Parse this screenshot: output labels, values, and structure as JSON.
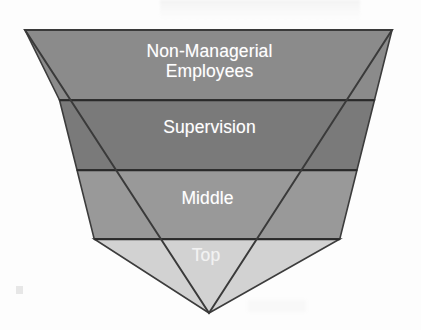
{
  "diagram": {
    "type": "inverted-pyramid",
    "background_color": "#fdfdfd",
    "outline_color": "#3c3c3c",
    "divider_color": "#2e2e2e",
    "label_color": "#ffffff",
    "geometry": {
      "top_left_x": 25,
      "top_right_x": 392,
      "top_y": 30,
      "apex_x": 209,
      "apex_y": 313
    },
    "levels": [
      {
        "label": "Non-Managerial Employees",
        "label_lines": [
          "Non-Managerial",
          "Employees"
        ],
        "fill_color": "#8b8b8b",
        "order": 1,
        "top_y": 30,
        "bottom_y": 100
      },
      {
        "label": "Supervision",
        "label_lines": [
          "Supervision"
        ],
        "fill_color": "#7a7a7a",
        "order": 2,
        "top_y": 100,
        "bottom_y": 170
      },
      {
        "label": "Middle",
        "label_lines": [
          "Middle"
        ],
        "fill_color": "#999999",
        "order": 3,
        "top_y": 170,
        "bottom_y": 239
      },
      {
        "label": "Top",
        "label_lines": [
          "Top"
        ],
        "fill_color": "#d2d2d2",
        "order": 4,
        "top_y": 239,
        "bottom_y": 313
      }
    ]
  }
}
